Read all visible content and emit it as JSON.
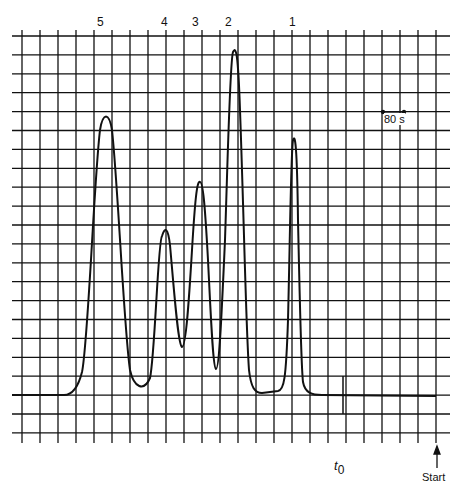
{
  "chart_data": {
    "type": "line",
    "title": "",
    "xlabel": "",
    "ylabel": "",
    "grid": true,
    "peak_labels": [
      "5",
      "4",
      "3",
      "2",
      "1"
    ],
    "annotations": {
      "scale_bar": "80 s",
      "t0_label": "t0",
      "start_label": "Start"
    },
    "series": [
      {
        "name": "chromatogram",
        "peaks": [
          {
            "label": "5",
            "x_grid": 4.7,
            "height_grid": 15.0
          },
          {
            "label": "4",
            "x_grid": 7.9,
            "height_grid": 9.0
          },
          {
            "label": "3",
            "x_grid": 9.8,
            "height_grid": 11.5
          },
          {
            "label": "2",
            "x_grid": 11.7,
            "height_grid": 18.7
          },
          {
            "label": "1",
            "x_grid": 15.0,
            "height_grid": 14.0
          }
        ]
      }
    ],
    "grid_divisions": {
      "x": 23,
      "y": 22
    },
    "time_per_division": "80 s"
  },
  "labels": {
    "peak5": "5",
    "peak4": "4",
    "peak3": "3",
    "peak2": "2",
    "peak1": "1",
    "scale": "80 s",
    "t0_main": "t",
    "t0_sub": "0",
    "start": "Start"
  }
}
